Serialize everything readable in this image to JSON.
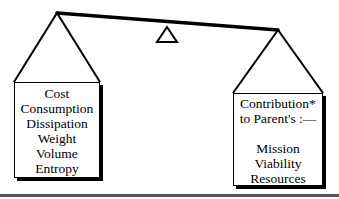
{
  "diagram": {
    "type": "balance-scale",
    "beam": {
      "left": [
        57,
        13
      ],
      "right": [
        278,
        30
      ]
    },
    "fulcrum": {
      "apex": [
        167,
        26
      ],
      "base_left": [
        157,
        42
      ],
      "base_right": [
        177,
        42
      ]
    },
    "left_pan": {
      "items": [
        "Cost",
        "Consumption",
        "Dissipation",
        "Weight",
        "Volume",
        "Entropy"
      ]
    },
    "right_pan": {
      "heading": [
        "Contribution*",
        "to Parent's :—"
      ],
      "items": [
        "Mission",
        "Viability",
        "Resources"
      ]
    }
  },
  "colors": {
    "ink": "#000000",
    "background": "#ffffff",
    "rule": "#555555"
  }
}
